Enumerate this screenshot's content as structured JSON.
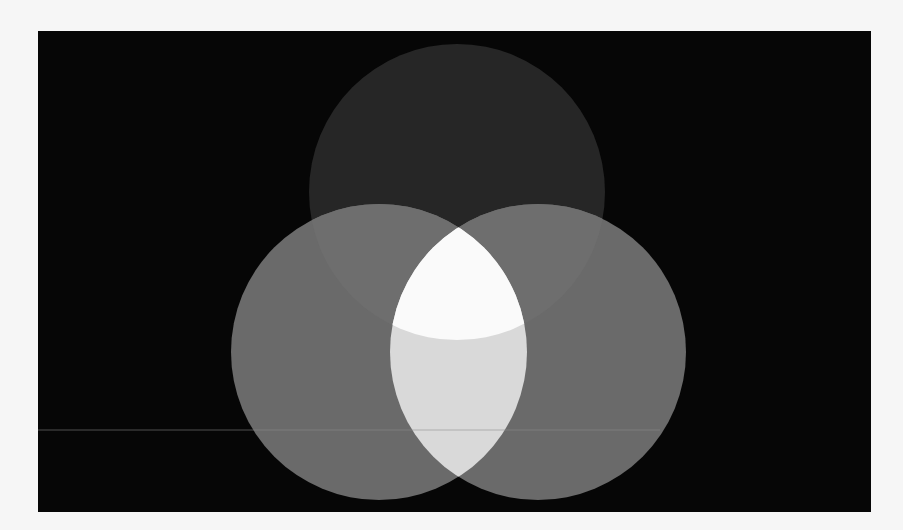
{
  "diagram": {
    "type": "venn-3-circle",
    "background_color": "#060606",
    "page_color": "#f6f6f6",
    "frame": {
      "x": 38,
      "y": 31,
      "width": 833,
      "height": 481
    },
    "circles": [
      {
        "id": "top",
        "cx": 419,
        "cy": 161,
        "r": 148,
        "color": "#262626"
      },
      {
        "id": "left",
        "cx": 341,
        "cy": 321,
        "r": 148,
        "color": "#6a6a6a"
      },
      {
        "id": "right",
        "cx": 500,
        "cy": 321,
        "r": 148,
        "color": "#6a6a6a"
      }
    ],
    "regions": {
      "top_only": "#262626",
      "left_only": "#6a6a6a",
      "right_only": "#6a6a6a",
      "top_and_left": "#6e6e6e",
      "top_and_right": "#6e6e6e",
      "left_and_right": "#d9d9d9",
      "all_three": "#fafafa"
    },
    "artifacts": {
      "scan_line": {
        "y": 399,
        "x1": 0,
        "x2": 622,
        "color": "#8a8a8a",
        "opacity": 0.55
      }
    }
  }
}
